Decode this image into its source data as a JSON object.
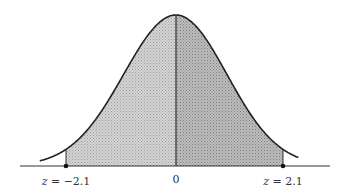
{
  "figure": {
    "type": "normal-distribution-curve",
    "labels": {
      "left": "z = −2.1",
      "center": "0",
      "right": "z = 2.1"
    },
    "shaded_region": {
      "from": -2.1,
      "to": 2.1
    },
    "colors": {
      "curve": "#222222",
      "axis": "#333333",
      "shade_left": "#c9c9c9",
      "shade_right": "#b2b2b2"
    }
  }
}
